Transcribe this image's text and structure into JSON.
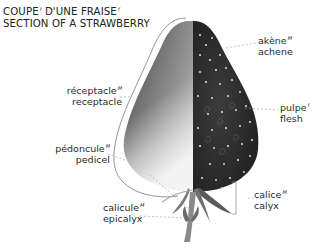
{
  "title": {
    "line1_fr": "COUPE",
    "line1_fr_gender": "f",
    "line1_mid": " D'UNE FRAISE",
    "line1_end_gender": "f",
    "line2_en": "SECTION OF A STRAWBERRY"
  },
  "labels": [
    {
      "id": "achene",
      "fr": "akène",
      "gender": "M",
      "en": "achene"
    },
    {
      "id": "receptacle",
      "fr": "réceptacle",
      "gender": "M",
      "en": "receptacle"
    },
    {
      "id": "flesh",
      "fr": "pulpe",
      "gender": "f",
      "en": "flesh"
    },
    {
      "id": "pedicel",
      "fr": "pédoncule",
      "gender": "M",
      "en": "pedicel"
    },
    {
      "id": "calyx",
      "fr": "calice",
      "gender": "M",
      "en": "calyx"
    },
    {
      "id": "epicalyx",
      "fr": "calicule",
      "gender": "M",
      "en": "epicalyx"
    }
  ],
  "colors": {
    "fruit_dark": "#2e2e2e",
    "fruit_light": "#d8d8d8",
    "leader_line": "#9a9a9a"
  }
}
